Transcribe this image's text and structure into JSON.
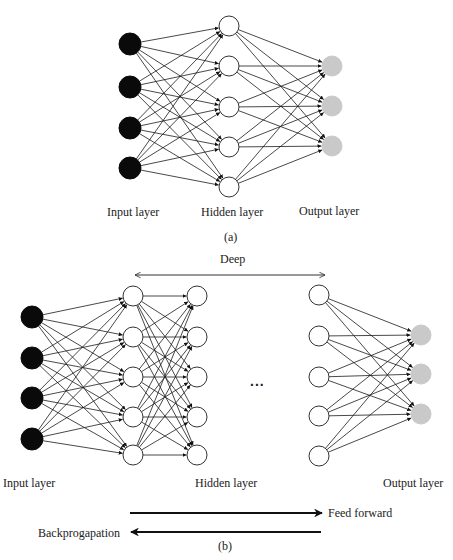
{
  "colors": {
    "input_node": "#0a0a0a",
    "hidden_node_fill": "#ffffff",
    "hidden_node_stroke": "#333333",
    "output_node": "#c9c9c9",
    "edge": "#1a1a1a",
    "text": "#222222"
  },
  "diagram_a": {
    "caption": "(a)",
    "labels": {
      "input": "Input layer",
      "hidden": "Hidden layer",
      "output": "Output layer"
    },
    "layers": [
      {
        "type": "input",
        "x": 130,
        "r": 11,
        "ys": [
          44,
          87,
          128,
          168
        ]
      },
      {
        "type": "hidden",
        "x": 229,
        "r": 10,
        "ys": [
          26,
          66,
          107,
          147,
          187
        ]
      },
      {
        "type": "output",
        "x": 332,
        "r": 10,
        "ys": [
          66,
          106,
          146
        ]
      }
    ]
  },
  "diagram_b": {
    "caption": "(b)",
    "deep_label": "Deep",
    "ellipsis": "...",
    "labels": {
      "input": "Input layer",
      "hidden": "Hidden layer",
      "output": "Output layer"
    },
    "feed_forward_label": "Feed forward",
    "backprop_label": "Backprogapation",
    "layers": [
      {
        "type": "input",
        "x": 32,
        "r": 11,
        "ys": [
          317,
          358,
          398,
          439
        ]
      },
      {
        "type": "hidden",
        "x": 133,
        "r": 10,
        "ys": [
          296,
          337,
          377,
          417,
          455
        ]
      },
      {
        "type": "hidden",
        "x": 197,
        "r": 10,
        "ys": [
          296,
          337,
          377,
          417,
          455
        ]
      },
      {
        "type": "hidden",
        "x": 319,
        "r": 10,
        "ys": [
          295,
          336,
          377,
          416,
          456
        ],
        "gap_before": true
      },
      {
        "type": "output",
        "x": 421,
        "r": 10,
        "ys": [
          335,
          374,
          414
        ]
      }
    ]
  }
}
